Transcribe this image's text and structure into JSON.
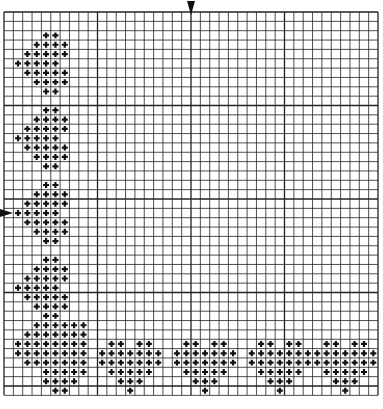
{
  "pattern": {
    "title": "Heart border cross-stitch chart",
    "grid": {
      "cols": 40,
      "rows": 41,
      "origin_x": 4,
      "origin_y": 12,
      "cell": 9.35,
      "line_color": "#222222",
      "background": "#ffffff"
    },
    "stitch_symbol": "+",
    "stitch_color": "#111111",
    "center_markers": {
      "top_arrow_col": 20,
      "left_arrow_row": 21,
      "arrow_color": "#111111"
    },
    "motifs": [
      {
        "name": "side-heart-1",
        "origin": [
          0,
          2
        ],
        "rows": [
          [
            4,
            5
          ],
          [
            3,
            4,
            5,
            6
          ],
          [
            2,
            3,
            4,
            5,
            6
          ],
          [
            1,
            2,
            3,
            4,
            5
          ],
          [
            2,
            3,
            4,
            5,
            6
          ],
          [
            3,
            4,
            5,
            6
          ],
          [
            4,
            5
          ]
        ]
      },
      {
        "name": "side-heart-2",
        "origin": [
          0,
          10
        ],
        "rows": [
          [
            4,
            5
          ],
          [
            3,
            4,
            5,
            6
          ],
          [
            2,
            3,
            4,
            5,
            6
          ],
          [
            1,
            2,
            3,
            4,
            5
          ],
          [
            2,
            3,
            4,
            5,
            6
          ],
          [
            3,
            4,
            5,
            6
          ],
          [
            4,
            5
          ]
        ]
      },
      {
        "name": "side-heart-3",
        "origin": [
          0,
          18
        ],
        "rows": [
          [
            4,
            5
          ],
          [
            3,
            4,
            5,
            6
          ],
          [
            2,
            3,
            4,
            5,
            6
          ],
          [
            1,
            2,
            3,
            4,
            5
          ],
          [
            2,
            3,
            4,
            5,
            6
          ],
          [
            3,
            4,
            5,
            6
          ],
          [
            4,
            5
          ]
        ]
      },
      {
        "name": "side-heart-4",
        "origin": [
          0,
          26
        ],
        "rows": [
          [
            4,
            5
          ],
          [
            3,
            4,
            5,
            6
          ],
          [
            2,
            3,
            4,
            5,
            6
          ],
          [
            1,
            2,
            3,
            4,
            5
          ],
          [
            2,
            3,
            4,
            5,
            6
          ],
          [
            3,
            4,
            5,
            6
          ],
          [
            4,
            5
          ]
        ]
      },
      {
        "name": "corner-heart",
        "origin": [
          0,
          33
        ],
        "rows": [
          [
            3,
            4,
            5,
            6,
            7,
            8
          ],
          [
            2,
            3,
            4,
            5,
            6,
            7,
            8
          ],
          [
            1,
            2,
            3,
            4,
            5,
            6,
            7,
            8
          ],
          [
            1,
            2,
            3,
            4,
            5,
            6,
            7,
            8
          ],
          [
            2,
            3,
            4,
            5,
            6,
            7,
            8
          ],
          [
            4,
            5,
            6,
            7,
            8
          ],
          [
            4,
            5,
            6,
            7
          ],
          [
            5,
            6
          ]
        ]
      },
      {
        "name": "bottom-heart-1",
        "origin": [
          10,
          35
        ],
        "rows": [
          [
            1,
            2,
            4,
            5
          ],
          [
            0,
            1,
            2,
            3,
            4,
            5,
            6
          ],
          [
            0,
            1,
            2,
            3,
            4,
            5,
            6
          ],
          [
            1,
            2,
            3,
            4,
            5
          ],
          [
            2,
            3,
            4
          ],
          [
            3
          ]
        ]
      },
      {
        "name": "bottom-heart-2",
        "origin": [
          18,
          35
        ],
        "rows": [
          [
            1,
            2,
            4,
            5
          ],
          [
            0,
            1,
            2,
            3,
            4,
            5,
            6
          ],
          [
            0,
            1,
            2,
            3,
            4,
            5,
            6
          ],
          [
            1,
            2,
            3,
            4,
            5
          ],
          [
            2,
            3,
            4
          ],
          [
            3
          ]
        ]
      },
      {
        "name": "bottom-heart-3",
        "origin": [
          26,
          35
        ],
        "rows": [
          [
            1,
            2,
            4,
            5
          ],
          [
            0,
            1,
            2,
            3,
            4,
            5,
            6
          ],
          [
            0,
            1,
            2,
            3,
            4,
            5,
            6
          ],
          [
            1,
            2,
            3,
            4,
            5
          ],
          [
            2,
            3,
            4
          ],
          [
            3
          ]
        ]
      },
      {
        "name": "bottom-heart-4",
        "origin": [
          33,
          35
        ],
        "rows": [
          [
            1,
            2,
            4,
            5
          ],
          [
            0,
            1,
            2,
            3,
            4,
            5,
            6
          ],
          [
            0,
            1,
            2,
            3,
            4,
            5,
            6
          ],
          [
            1,
            2,
            3,
            4,
            5
          ],
          [
            2,
            3,
            4
          ],
          [
            3
          ]
        ]
      }
    ]
  }
}
